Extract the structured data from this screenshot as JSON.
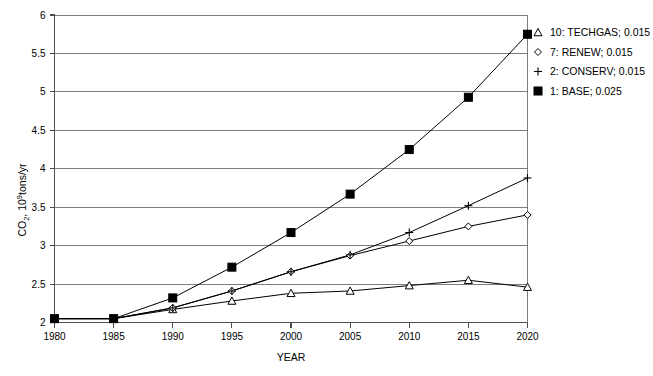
{
  "chart_data": {
    "type": "line",
    "title": "",
    "xlabel": "YEAR",
    "ylabel": "CO 2 , 10 9 tons/yr",
    "ylabel_parts": {
      "base1": "CO",
      "sub1": "2",
      "mid": ", 10",
      "sup1": "9",
      "tail": "tons/yr"
    },
    "x": [
      1980,
      1985,
      1990,
      1995,
      2000,
      2005,
      2010,
      2015,
      2020
    ],
    "categories": [
      "1980",
      "1985",
      "1990",
      "1995",
      "2000",
      "2005",
      "2010",
      "2015",
      "2020"
    ],
    "xlim": [
      1980,
      2020
    ],
    "ylim": [
      2,
      6
    ],
    "yticks": [
      2,
      2.5,
      3,
      3.5,
      4,
      4.5,
      5,
      5.5,
      6
    ],
    "ytick_labels": [
      "2",
      "2.5",
      "3",
      "3.5",
      "4",
      "4.5",
      "5",
      "5.5",
      "6"
    ],
    "grid": true,
    "legend_position": "top-right",
    "series": [
      {
        "name": "10: TECHGAS; 0.015",
        "label_number": "10",
        "label_scenario": "TECHGAS",
        "label_value": "0.015",
        "marker": "triangle",
        "values": [
          2.05,
          2.05,
          2.17,
          2.28,
          2.38,
          2.41,
          2.48,
          2.55,
          2.46
        ]
      },
      {
        "name": "7: RENEW; 0.015",
        "label_number": "7",
        "label_scenario": "RENEW",
        "label_value": "0.015",
        "marker": "diamond",
        "values": [
          2.05,
          2.05,
          2.19,
          2.41,
          2.66,
          2.87,
          3.06,
          3.25,
          3.4
        ]
      },
      {
        "name": "2: CONSERV; 0.015",
        "label_number": "2",
        "label_scenario": "CONSERV",
        "label_value": "0.015",
        "marker": "plus",
        "values": [
          2.05,
          2.05,
          2.19,
          2.41,
          2.66,
          2.88,
          3.17,
          3.52,
          3.88
        ]
      },
      {
        "name": "1: BASE; 0.025",
        "label_number": "1",
        "label_scenario": "BASE",
        "label_value": "0.025",
        "marker": "square-filled",
        "values": [
          2.05,
          2.05,
          2.32,
          2.72,
          3.17,
          3.67,
          4.25,
          4.93,
          5.75
        ]
      }
    ]
  },
  "legend": {
    "items": [
      {
        "marker": "triangle",
        "text": "10: TECHGAS; 0.015"
      },
      {
        "marker": "diamond",
        "text": "7: RENEW; 0.015"
      },
      {
        "marker": "plus",
        "text": "2: CONSERV; 0.015"
      },
      {
        "marker": "square-filled",
        "text": "1: BASE; 0.025"
      }
    ]
  },
  "axes": {
    "x_title": "YEAR",
    "y_title": "CO2, 10^9 tons/yr"
  }
}
